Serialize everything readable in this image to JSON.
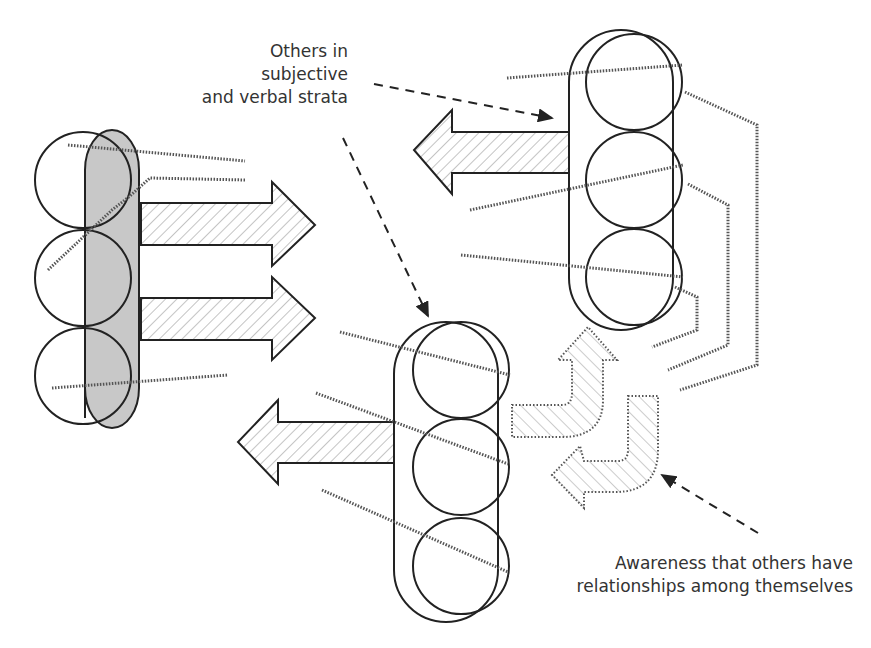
{
  "labels": {
    "others_strata": {
      "lines": [
        "Others in",
        "subjective",
        "and verbal strata"
      ]
    },
    "awareness": {
      "lines": [
        "Awareness that others have",
        "relationships among themselves"
      ]
    }
  },
  "figures": {
    "self": {
      "role": "self-figure",
      "fill": "#c8c8c8",
      "circles": 3
    },
    "other_top_right": {
      "role": "other-figure",
      "circles": 3
    },
    "other_bottom_middle": {
      "role": "other-figure",
      "circles": 3
    }
  },
  "colors": {
    "stroke": "#222222",
    "hatch": "#999999",
    "dotted": "#555555",
    "shaded": "#c8c8c8"
  }
}
